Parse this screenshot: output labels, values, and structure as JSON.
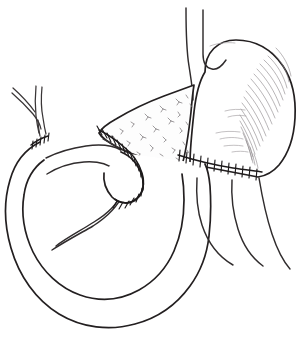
{
  "figure": {
    "title": "Roux-en-Y reconstruction after pancreaticoduodenectomy",
    "caption": "",
    "background_color": "#ffffff",
    "ink_color": "#231f20",
    "shading_color": "#8d898c",
    "width": 298,
    "height": 337
  },
  "structures": {
    "esophagus": {
      "label": "Esophagus",
      "description": "Tubular structure descending from the top of the image into the gastric cardia"
    },
    "stomach": {
      "label": "Stomach",
      "description": "Large rounded viscus occupying the upper right, shaded with fine parallel hatching along the greater curvature"
    },
    "pancreas_remnant": {
      "label": "Pancreatic remnant",
      "description": "Wedge shaped body and tail with stippled glandular texture, running from upper right down to the left"
    },
    "hepatic_duct": {
      "label": "Hepatic duct branches",
      "description": "Y shaped bifurcating duct at the upper left joining the jejunal limb"
    },
    "roux_limb": {
      "label": "Roux jejunal limb",
      "description": "Looping small bowel limb forming a broad C shaped coil across the lower half of the drawing"
    },
    "efferent_limb": {
      "label": "Efferent jejunal limb",
      "description": "Bowel limb descending from the gastric anastomosis on the right side"
    },
    "jejunal_blind_end": {
      "label": "Blind end of jejunal limb",
      "description": "Rounded closed end of the Roux limb in the center of the drawing"
    }
  },
  "anastomoses": [
    {
      "id": "hepaticojejunostomy",
      "label": "Hepaticojejunostomy",
      "position": "upper left",
      "stitch_count": 5,
      "description": "Short suture line where the hepatic duct meets the jejunal limb"
    },
    {
      "id": "pancreaticojejunostomy",
      "label": "Pancreaticojejunostomy",
      "position": "center",
      "stitch_count": 19,
      "description": "Long curved suture line wrapping the pancreatic remnant onto the jejunal limb"
    },
    {
      "id": "gastrojejunostomy",
      "label": "Gastrojejunostomy",
      "position": "right of center",
      "stitch_count": 12,
      "description": "Horizontal suture line across the inferior border of the stomach"
    }
  ]
}
